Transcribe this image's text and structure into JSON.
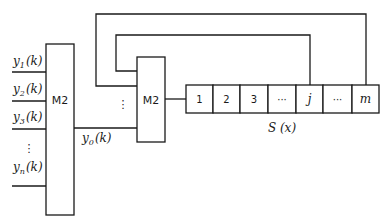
{
  "diagram": {
    "left_mux": {
      "label": "M2"
    },
    "right_mux": {
      "label": "M2"
    },
    "inputs": [
      {
        "base": "y",
        "sub": "1",
        "arg": "(k)"
      },
      {
        "base": "y",
        "sub": "2",
        "arg": "(k)"
      },
      {
        "base": "y",
        "sub": "3",
        "arg": "(k)"
      },
      {
        "base": "y",
        "sub": "n",
        "arg": "(k)"
      }
    ],
    "input_ellipsis": "⋮",
    "output": {
      "base": "y",
      "sub": "0",
      "arg": "(k)"
    },
    "right_mux_ellipsis": "⋮",
    "register": {
      "cells": [
        "1",
        "2",
        "3",
        "···",
        "j",
        "···",
        "m"
      ],
      "label": "S (x)"
    },
    "feedback_taps": [
      "j",
      "m"
    ]
  }
}
